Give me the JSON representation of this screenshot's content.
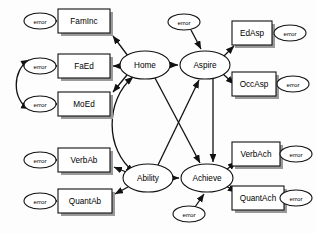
{
  "diagram": {
    "type": "path-diagram",
    "colors": {
      "stroke": "#111111",
      "fill": "#ffffff",
      "background": "#fdfdfd",
      "shadow": "#9a9a9a"
    },
    "error_label": "error",
    "latents": [
      {
        "id": "home",
        "label": "Home",
        "cx": 145,
        "cy": 65,
        "rx": 25,
        "ry": 14
      },
      {
        "id": "aspire",
        "label": "Aspire",
        "cx": 205,
        "cy": 65,
        "rx": 25,
        "ry": 14
      },
      {
        "id": "ability",
        "label": "Ability",
        "cx": 148,
        "cy": 178,
        "rx": 25,
        "ry": 14
      },
      {
        "id": "achieve",
        "label": "Achieve",
        "cx": 207,
        "cy": 178,
        "rx": 26,
        "ry": 14
      }
    ],
    "observed": [
      {
        "id": "faminc",
        "label": "FamInc",
        "x": 58,
        "y": 9,
        "w": 52,
        "h": 24
      },
      {
        "id": "faed",
        "label": "FaEd",
        "x": 58,
        "y": 54,
        "w": 52,
        "h": 24
      },
      {
        "id": "moed",
        "label": "MoEd",
        "x": 58,
        "y": 92,
        "w": 52,
        "h": 24
      },
      {
        "id": "verbab",
        "label": "VerbAb",
        "x": 58,
        "y": 148,
        "w": 52,
        "h": 24
      },
      {
        "id": "quantab",
        "label": "QuantAb",
        "x": 58,
        "y": 189,
        "w": 54,
        "h": 24
      },
      {
        "id": "edasp",
        "label": "EdAsp",
        "x": 232,
        "y": 21,
        "w": 40,
        "h": 24
      },
      {
        "id": "occasp",
        "label": "OccAsp",
        "x": 232,
        "y": 72,
        "w": 44,
        "h": 24
      },
      {
        "id": "verbach",
        "label": "VerbAch",
        "x": 232,
        "y": 142,
        "w": 48,
        "h": 24
      },
      {
        "id": "quantach",
        "label": "QuantAch",
        "x": 232,
        "y": 186,
        "w": 52,
        "h": 24
      }
    ],
    "errors": [
      {
        "id": "e-faminc",
        "cx": 40,
        "cy": 21,
        "rx": 16,
        "ry": 8
      },
      {
        "id": "e-faed",
        "cx": 40,
        "cy": 66,
        "rx": 16,
        "ry": 8
      },
      {
        "id": "e-moed",
        "cx": 40,
        "cy": 104,
        "rx": 16,
        "ry": 8
      },
      {
        "id": "e-verbab",
        "cx": 40,
        "cy": 160,
        "rx": 16,
        "ry": 8
      },
      {
        "id": "e-quantab",
        "cx": 40,
        "cy": 201,
        "rx": 16,
        "ry": 8
      },
      {
        "id": "e-edasp",
        "cx": 290,
        "cy": 33,
        "rx": 16,
        "ry": 8
      },
      {
        "id": "e-occasp",
        "cx": 293,
        "cy": 84,
        "rx": 16,
        "ry": 8
      },
      {
        "id": "e-verbach",
        "cx": 296,
        "cy": 154,
        "rx": 16,
        "ry": 8
      },
      {
        "id": "e-quantach",
        "cx": 296,
        "cy": 198,
        "rx": 16,
        "ry": 8
      },
      {
        "id": "d-aspire",
        "cx": 184,
        "cy": 22,
        "rx": 16,
        "ry": 8
      },
      {
        "id": "d-achieve",
        "cx": 189,
        "cy": 214,
        "rx": 16,
        "ry": 8
      }
    ],
    "paths": [
      {
        "from": "home",
        "to": "faminc",
        "kind": "directed"
      },
      {
        "from": "home",
        "to": "faed",
        "kind": "directed"
      },
      {
        "from": "home",
        "to": "moed",
        "kind": "directed"
      },
      {
        "from": "ability",
        "to": "verbab",
        "kind": "directed"
      },
      {
        "from": "ability",
        "to": "quantab",
        "kind": "directed"
      },
      {
        "from": "aspire",
        "to": "edasp",
        "kind": "directed"
      },
      {
        "from": "aspire",
        "to": "occasp",
        "kind": "directed"
      },
      {
        "from": "achieve",
        "to": "verbach",
        "kind": "directed"
      },
      {
        "from": "achieve",
        "to": "quantach",
        "kind": "directed"
      },
      {
        "from": "home",
        "to": "aspire",
        "kind": "directed"
      },
      {
        "from": "home",
        "to": "achieve",
        "kind": "directed"
      },
      {
        "from": "ability",
        "to": "aspire",
        "kind": "directed"
      },
      {
        "from": "ability",
        "to": "achieve",
        "kind": "directed"
      },
      {
        "from": "aspire",
        "to": "achieve",
        "kind": "directed"
      },
      {
        "from": "home",
        "to": "ability",
        "kind": "covariance"
      },
      {
        "from": "e-faed",
        "to": "e-moed",
        "kind": "covariance"
      },
      {
        "from": "e-faminc",
        "to": "faminc",
        "kind": "directed"
      },
      {
        "from": "e-faed",
        "to": "faed",
        "kind": "directed"
      },
      {
        "from": "e-moed",
        "to": "moed",
        "kind": "directed"
      },
      {
        "from": "e-verbab",
        "to": "verbab",
        "kind": "directed"
      },
      {
        "from": "e-quantab",
        "to": "quantab",
        "kind": "directed"
      },
      {
        "from": "e-edasp",
        "to": "edasp",
        "kind": "directed"
      },
      {
        "from": "e-occasp",
        "to": "occasp",
        "kind": "directed"
      },
      {
        "from": "e-verbach",
        "to": "verbach",
        "kind": "directed"
      },
      {
        "from": "e-quantach",
        "to": "quantach",
        "kind": "directed"
      },
      {
        "from": "d-aspire",
        "to": "aspire",
        "kind": "directed"
      },
      {
        "from": "d-achieve",
        "to": "achieve",
        "kind": "directed"
      }
    ]
  }
}
